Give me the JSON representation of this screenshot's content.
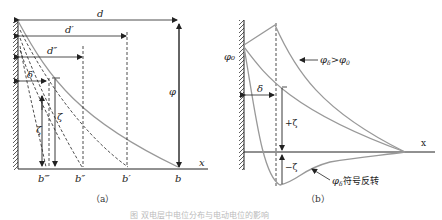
{
  "panel_a": {
    "caption": "（a）",
    "labels": {
      "d": "d",
      "d_prime": "d′",
      "d_double": "d″",
      "delta": "δ",
      "phi": "φ",
      "zeta": "ζ",
      "zeta2": "ζ",
      "x_axis": "x",
      "b_triple": "b‴",
      "b_double": "b″",
      "b_prime": "b′",
      "b": "b"
    }
  },
  "panel_b": {
    "caption": "（b）",
    "labels": {
      "phi0": "φ₀",
      "phi_delta_gt": "φδ>φ0",
      "phi_delta_gt_main": "φ",
      "phi_delta_gt_sub1": "δ",
      "phi_delta_gt_rel": ">φ",
      "phi_delta_gt_sub2": "0",
      "delta": "δ",
      "plus_zeta": "+ζ",
      "minus_zeta": "−ζ",
      "x_axis": "x",
      "sign_reversal_main": "φ",
      "sign_reversal_sub": "δ",
      "sign_reversal_text": "符号反转"
    }
  },
  "figure_caption": "图 双电层中电位分布与电动电位的影响"
}
